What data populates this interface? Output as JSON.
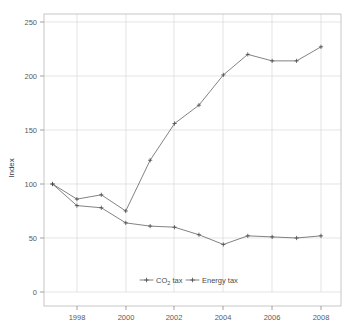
{
  "chart_data": {
    "type": "line",
    "title": "",
    "xlabel": "",
    "ylabel": "Index",
    "xlim": [
      1996.5,
      2008.6
    ],
    "ylim": [
      0,
      250
    ],
    "grid": true,
    "legend_position": "inside-bottom-center",
    "x": [
      1997,
      1998,
      1999,
      2000,
      2001,
      2002,
      2003,
      2004,
      2005,
      2006,
      2007,
      2008
    ],
    "xticks": [
      1998,
      2000,
      2002,
      2004,
      2006,
      2008
    ],
    "xtick_labels": [
      "1998",
      "2000",
      "2002",
      "2004",
      "2006",
      "2008"
    ],
    "yticks": [
      0,
      50,
      100,
      150,
      200,
      250
    ],
    "ytick_labels": [
      "0",
      "50",
      "100",
      "150",
      "200",
      "250"
    ],
    "series": [
      {
        "name": "CO2 tax",
        "label_main": "CO",
        "label_sub": "2",
        "label_tail": " tax",
        "color": "#6b6b6b",
        "marker": "cross",
        "values": [
          100,
          80,
          78,
          64,
          61,
          60,
          53,
          44,
          52,
          51,
          50,
          52
        ]
      },
      {
        "name": "Energy tax",
        "label_main": "Energy tax",
        "label_sub": "",
        "label_tail": "",
        "color": "#6b6b6b",
        "marker": "cross",
        "values": [
          100,
          86,
          90,
          75,
          122,
          156,
          173,
          201,
          220,
          214,
          214,
          227
        ]
      }
    ]
  },
  "axis": {
    "ylabel": "Index"
  },
  "legend": {
    "item1_main": "CO",
    "item1_sub": "2",
    "item1_tail": " tax",
    "item2_main": "Energy tax"
  }
}
